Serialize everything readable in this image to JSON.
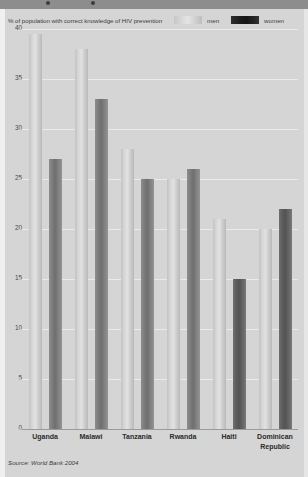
{
  "header": {
    "title": "% of population with correct knowledge of HIV prevention",
    "legend": [
      {
        "label": "men",
        "color": "#d9d9d9"
      },
      {
        "label": "women",
        "color": "#1d1d1d"
      }
    ]
  },
  "source": "Source: World Bank 2004",
  "chart_data": {
    "type": "bar",
    "title": "% of population with correct knowledge of HIV prevention",
    "xlabel": "",
    "ylabel": "",
    "ylim": [
      0,
      40
    ],
    "yticks": [
      0,
      5,
      10,
      15,
      20,
      25,
      30,
      35,
      40
    ],
    "grid": true,
    "legend_position": "top-right",
    "categories": [
      "Uganda",
      "Malawi",
      "Tanzania",
      "Rwanda",
      "Haiti",
      "Dominican Republic"
    ],
    "series": [
      {
        "name": "men",
        "color": "#d9d9d9",
        "values": [
          39.5,
          38,
          28,
          25,
          21,
          20
        ]
      },
      {
        "name": "women",
        "color": "#6f6f6f",
        "values": [
          27,
          33,
          25,
          26,
          15,
          22
        ]
      }
    ]
  }
}
